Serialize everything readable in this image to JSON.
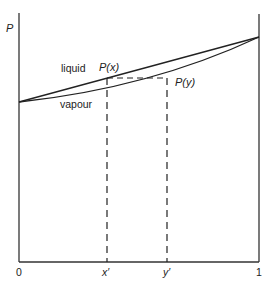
{
  "diagram": {
    "type": "vapour-liquid pressure-composition diagram",
    "axis_y_label": "P",
    "x_tick_labels": [
      "0",
      "x′",
      "y′",
      "1"
    ],
    "curve_labels": {
      "liquid": "liquid",
      "vapour": "vapour"
    },
    "point_labels": {
      "px": "P(x)",
      "py": "P(y)"
    }
  }
}
